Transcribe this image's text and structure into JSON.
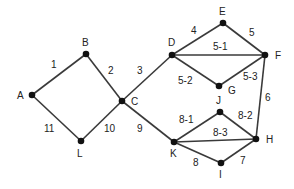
{
  "diagram": {
    "type": "graph",
    "nodes": [
      {
        "id": "A",
        "x": 32,
        "y": 95,
        "lx": 17,
        "ly": 99
      },
      {
        "id": "B",
        "x": 86,
        "y": 54,
        "lx": 82,
        "ly": 46
      },
      {
        "id": "C",
        "x": 122,
        "y": 101,
        "lx": 131,
        "ly": 105
      },
      {
        "id": "L",
        "x": 81,
        "y": 141,
        "lx": 77,
        "ly": 157
      },
      {
        "id": "D",
        "x": 172,
        "y": 55,
        "lx": 168,
        "ly": 46
      },
      {
        "id": "E",
        "x": 223,
        "y": 23,
        "lx": 219,
        "ly": 15
      },
      {
        "id": "F",
        "x": 265,
        "y": 55,
        "lx": 275,
        "ly": 59
      },
      {
        "id": "G",
        "x": 219,
        "y": 86,
        "lx": 228,
        "ly": 94
      },
      {
        "id": "J",
        "x": 220,
        "y": 112,
        "lx": 216,
        "ly": 104
      },
      {
        "id": "H",
        "x": 256,
        "y": 139,
        "lx": 266,
        "ly": 143
      },
      {
        "id": "K",
        "x": 174,
        "y": 142,
        "lx": 170,
        "ly": 157
      },
      {
        "id": "I",
        "x": 221,
        "y": 163,
        "lx": 219,
        "ly": 178
      }
    ],
    "edges": [
      {
        "from": "A",
        "to": "B",
        "label": "1",
        "lx": 51,
        "ly": 68
      },
      {
        "from": "B",
        "to": "C",
        "label": "2",
        "lx": 108,
        "ly": 74
      },
      {
        "from": "C",
        "to": "D",
        "label": "3",
        "lx": 137,
        "ly": 74
      },
      {
        "from": "D",
        "to": "E",
        "label": "4",
        "lx": 191,
        "ly": 34
      },
      {
        "from": "E",
        "to": "F",
        "label": "5",
        "lx": 249,
        "ly": 36
      },
      {
        "from": "D",
        "to": "F",
        "label": "5-1",
        "lx": 213,
        "ly": 50
      },
      {
        "from": "D",
        "to": "G",
        "label": "5-2",
        "lx": 178,
        "ly": 84
      },
      {
        "from": "G",
        "to": "F",
        "label": "5-3",
        "lx": 243,
        "ly": 80
      },
      {
        "from": "F",
        "to": "H",
        "label": "6",
        "lx": 265,
        "ly": 101
      },
      {
        "from": "H",
        "to": "I",
        "label": "7",
        "lx": 240,
        "ly": 164
      },
      {
        "from": "K",
        "to": "I",
        "label": "8",
        "lx": 193,
        "ly": 166
      },
      {
        "from": "K",
        "to": "J",
        "label": "8-1",
        "lx": 179,
        "ly": 123
      },
      {
        "from": "J",
        "to": "H",
        "label": "8-2",
        "lx": 238,
        "ly": 119
      },
      {
        "from": "K",
        "to": "H",
        "label": "8-3",
        "lx": 213,
        "ly": 136
      },
      {
        "from": "C",
        "to": "K",
        "label": "9",
        "lx": 137,
        "ly": 132
      },
      {
        "from": "C",
        "to": "L",
        "label": "10",
        "lx": 104,
        "ly": 132
      },
      {
        "from": "A",
        "to": "L",
        "label": "11",
        "lx": 44,
        "ly": 132
      }
    ]
  }
}
